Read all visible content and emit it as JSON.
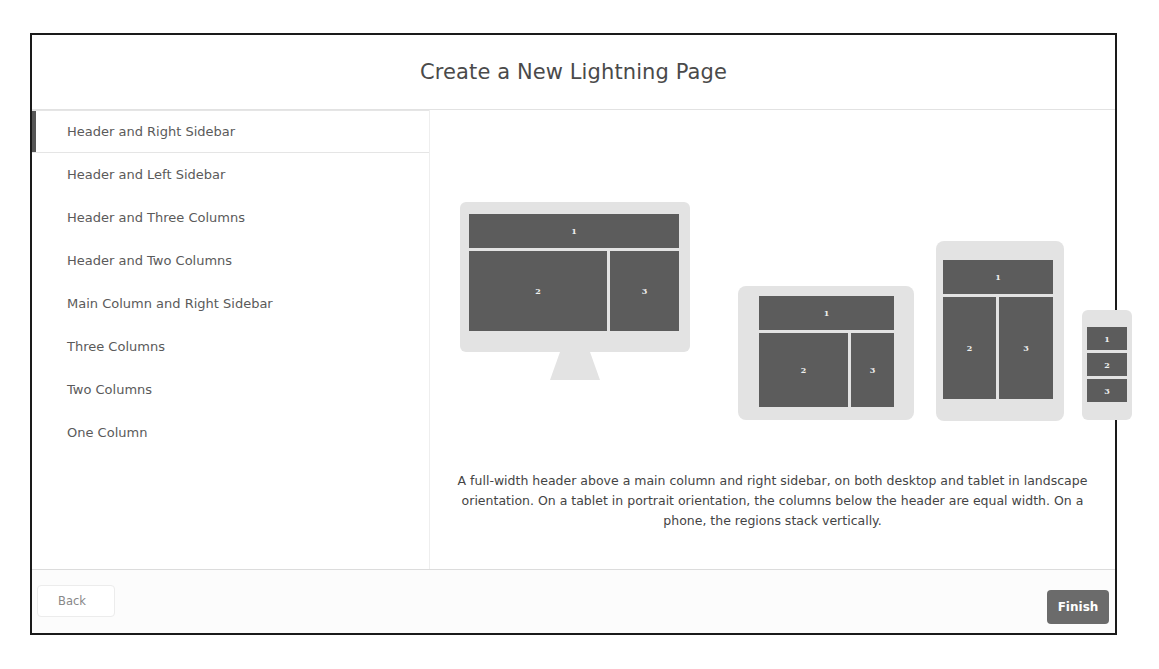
{
  "modal": {
    "title": "Create a New Lightning Page"
  },
  "templates": {
    "selected_index": 0,
    "items": [
      {
        "label": "Header and Right Sidebar"
      },
      {
        "label": "Header and Left Sidebar"
      },
      {
        "label": "Header and Three Columns"
      },
      {
        "label": "Header and Two Columns"
      },
      {
        "label": "Main Column and Right Sidebar"
      },
      {
        "label": "Three Columns"
      },
      {
        "label": "Two Columns"
      },
      {
        "label": "One Column"
      }
    ]
  },
  "preview": {
    "desktop": {
      "regions": [
        "1",
        "2",
        "3"
      ]
    },
    "tablet_landscape": {
      "regions": [
        "1",
        "2",
        "3"
      ]
    },
    "tablet_portrait": {
      "regions": [
        "1",
        "2",
        "3"
      ]
    },
    "phone": {
      "regions": [
        "1",
        "2",
        "3"
      ]
    },
    "description": "A full-width header above a main column and right sidebar, on both desktop and tablet in landscape orientation. On a tablet in portrait orientation, the columns below the header are equal width. On a phone, the regions stack vertically."
  },
  "footer": {
    "back_label": "Back",
    "finish_label": "Finish"
  },
  "colors": {
    "region": "#5c5c5c",
    "device_frame": "#e3e3e3",
    "finish_button": "#6b6b6b"
  }
}
